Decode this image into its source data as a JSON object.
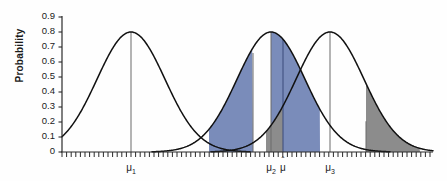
{
  "chart_data": {
    "type": "line",
    "title": "",
    "xlabel": "",
    "ylabel": "Probability",
    "ylim": [
      0,
      0.9
    ],
    "yticks": [
      "0.9",
      "0.8",
      "0.7",
      "0.6",
      "0.5",
      "0.4",
      "0.3",
      "0.2",
      "0.1",
      "0"
    ],
    "ytick_values": [
      0.9,
      0.8,
      0.7,
      0.6,
      0.5,
      0.4,
      0.3,
      0.2,
      0.1,
      0
    ],
    "grid": false,
    "legend": null,
    "xticks_labeled": [
      {
        "label": "μ",
        "sub": "1",
        "x_value": 131
      },
      {
        "label": "μ",
        "sub": "2",
        "x_value": 271
      },
      {
        "label": "μ",
        "sub": "",
        "x_value": 283,
        "hat": "ˆ"
      },
      {
        "label": "μ",
        "sub": "3",
        "x_value": 330
      }
    ],
    "series": [
      {
        "name": "curve-1",
        "mean": 131,
        "peak": 0.8,
        "sigma_px": 34
      },
      {
        "name": "curve-2",
        "mean": 271,
        "peak": 0.8,
        "sigma_px": 34
      },
      {
        "name": "curve-3",
        "mean": 330,
        "peak": 0.8,
        "sigma_px": 34
      }
    ],
    "shaded_regions": [
      {
        "name": "blue-left-lobe",
        "color": "#7a8cba",
        "curve": "curve-2",
        "from": 209,
        "to": 253
      },
      {
        "name": "blue-right-lobe",
        "color": "#7a8cba",
        "curve": "curve-2",
        "from": 271,
        "to": 320
      },
      {
        "name": "gray-left-tail",
        "color": "#8c8c8c",
        "curve": "curve-3",
        "from": 266,
        "to": 283
      },
      {
        "name": "gray-right-tail",
        "color": "#8c8c8c",
        "curve": "curve-3",
        "from": 366,
        "to": 420
      }
    ],
    "vertical_lines": [
      {
        "name": "mu1-line",
        "x_value": 131,
        "color": "#6b6b6b",
        "top": 0.8
      },
      {
        "name": "mu2-line",
        "x_value": 271,
        "color": "#6b6b6b",
        "top": 0.8
      },
      {
        "name": "mu-hat-line",
        "x_value": 283,
        "color": "#3b4a7a",
        "top": 0.755
      },
      {
        "name": "blue-edge-line",
        "x_value": 253,
        "color": "#6b6b6b",
        "top": 0.66
      },
      {
        "name": "mu3-line",
        "x_value": 330,
        "color": "#6b6b6b",
        "top": 0.8
      },
      {
        "name": "gray-tail-line",
        "x_value": 366,
        "color": "#6b6b6b",
        "top": 0.205
      }
    ],
    "axis": {
      "x_start": 62,
      "x_end": 433,
      "baseline_y": 152,
      "top_y": 17,
      "minor_tick_spacing": 4.6,
      "curve_color": "#111111",
      "axis_color": "#2a2a2a"
    }
  }
}
